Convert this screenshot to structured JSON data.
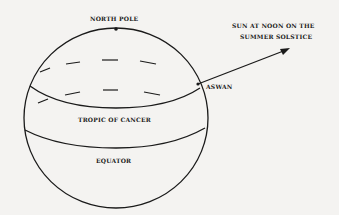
{
  "diagram": {
    "labels": {
      "north_pole": "NORTH POLE",
      "sun_line1": "SUN AT NOON ON THE",
      "sun_line2": "SUMMER SOLSTICE",
      "aswan": "ASWAN",
      "tropic": "TROPIC OF CANCER",
      "equator": "EQUATOR"
    },
    "colors": {
      "ink": "#1a1a1a",
      "background": "#f4f3f1"
    }
  }
}
